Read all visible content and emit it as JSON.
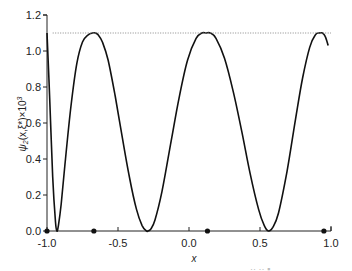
{
  "chart_data": {
    "type": "line",
    "title": "",
    "xlabel": "x",
    "ylabel": "ψ₂(x,ξ*)×10³",
    "ylabel_parts": {
      "psi": "ψ",
      "sub": "2",
      "args": "(x,ξ*)×10",
      "sup": "3"
    },
    "xlim": [
      -1.0,
      1.0
    ],
    "ylim": [
      0.0,
      1.2
    ],
    "xticks": [
      -1.0,
      -0.5,
      0.0,
      0.5,
      1.0
    ],
    "xtick_labels": [
      "-1.0",
      "-0.5",
      "0.0",
      "0.5",
      "1.0"
    ],
    "yticks": [
      0.0,
      0.2,
      0.4,
      0.6,
      0.8,
      1.0,
      1.2
    ],
    "ytick_labels": [
      "0.0",
      "0.2",
      "0.4",
      "0.6",
      "0.8",
      "1.0",
      "1.2"
    ],
    "grid": false,
    "legend": null,
    "series": [
      {
        "name": "psi2",
        "style": "solid",
        "color": "#111111",
        "x": [
          -1.0,
          -0.98,
          -0.96,
          -0.94,
          -0.93,
          -0.92,
          -0.9,
          -0.87,
          -0.83,
          -0.79,
          -0.75,
          -0.71,
          -0.68,
          -0.66,
          -0.64,
          -0.61,
          -0.57,
          -0.52,
          -0.47,
          -0.42,
          -0.37,
          -0.33,
          -0.3,
          -0.29,
          -0.27,
          -0.24,
          -0.19,
          -0.13,
          -0.07,
          -0.01,
          0.05,
          0.09,
          0.12,
          0.15,
          0.19,
          0.25,
          0.31,
          0.37,
          0.43,
          0.49,
          0.53,
          0.56,
          0.59,
          0.63,
          0.69,
          0.75,
          0.8,
          0.85,
          0.89,
          0.92,
          0.94,
          0.96,
          0.98
        ],
        "y": [
          1.1,
          0.72,
          0.3,
          0.05,
          0.0,
          0.03,
          0.15,
          0.4,
          0.7,
          0.93,
          1.05,
          1.09,
          1.1,
          1.1,
          1.09,
          1.05,
          0.95,
          0.75,
          0.52,
          0.3,
          0.12,
          0.03,
          0.0,
          0.0,
          0.01,
          0.06,
          0.22,
          0.48,
          0.74,
          0.95,
          1.07,
          1.1,
          1.1,
          1.1,
          1.07,
          0.96,
          0.78,
          0.56,
          0.32,
          0.12,
          0.03,
          0.0,
          0.02,
          0.1,
          0.33,
          0.62,
          0.85,
          1.02,
          1.09,
          1.1,
          1.1,
          1.08,
          1.03
        ]
      },
      {
        "name": "max-level",
        "style": "dotted",
        "color": "#888888",
        "x": [
          -0.96,
          1.0
        ],
        "y": [
          1.1,
          1.1
        ]
      }
    ],
    "markers": {
      "name": "nodes",
      "x": [
        -1.0,
        -0.67,
        0.13,
        0.95
      ],
      "y": [
        0.0,
        0.0,
        0.0,
        0.0
      ]
    }
  },
  "footer_fragment": "··      ·· ▪"
}
